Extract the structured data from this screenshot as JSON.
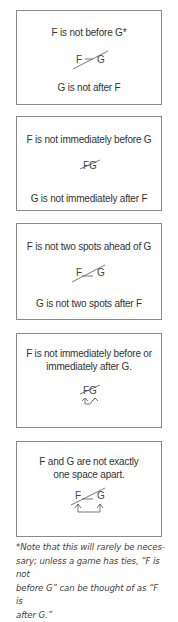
{
  "rules": [
    {
      "id": "not-before",
      "top_text": "F is not before G*",
      "diagram": {
        "left": "F",
        "right": "G",
        "connector": "dash",
        "strike": true,
        "arrows": "none"
      },
      "bottom_text": "G is not after F"
    },
    {
      "id": "not-immediately-before",
      "top_text": "F is not immediately before G",
      "diagram": {
        "left": "F",
        "right": "G",
        "connector": "adjacent",
        "strike": true,
        "arrows": "none"
      },
      "bottom_text": "G is not immediately after F"
    },
    {
      "id": "not-two-spots-ahead",
      "top_text": "F is not two spots ahead of G",
      "diagram": {
        "left": "F",
        "right": "G",
        "connector": "underscore",
        "strike": true,
        "arrows": "none"
      },
      "bottom_text": "G is not two spots after F"
    },
    {
      "id": "not-adjacent",
      "top_text_lines": [
        "F is not immediately before or",
        "immediately after G."
      ],
      "diagram": {
        "left": "F",
        "right": "G",
        "connector": "adjacent",
        "strike": true,
        "arrows": "swap"
      }
    },
    {
      "id": "not-one-space-apart",
      "top_text_lines": [
        "F and G are not exactly",
        "one space apart."
      ],
      "diagram": {
        "left": "F",
        "right": "G",
        "connector": "underscore",
        "strike": true,
        "arrows": "bracket"
      }
    }
  ],
  "footnote": {
    "lines": [
      "*Note that this will rarely be neces-",
      "sary; unless a game has ties, “F is not",
      "before G” can be thought of as “F is",
      "after G.”"
    ]
  },
  "colors": {
    "border": "#8a8a8a",
    "text": "#333333",
    "line": "#555555"
  }
}
